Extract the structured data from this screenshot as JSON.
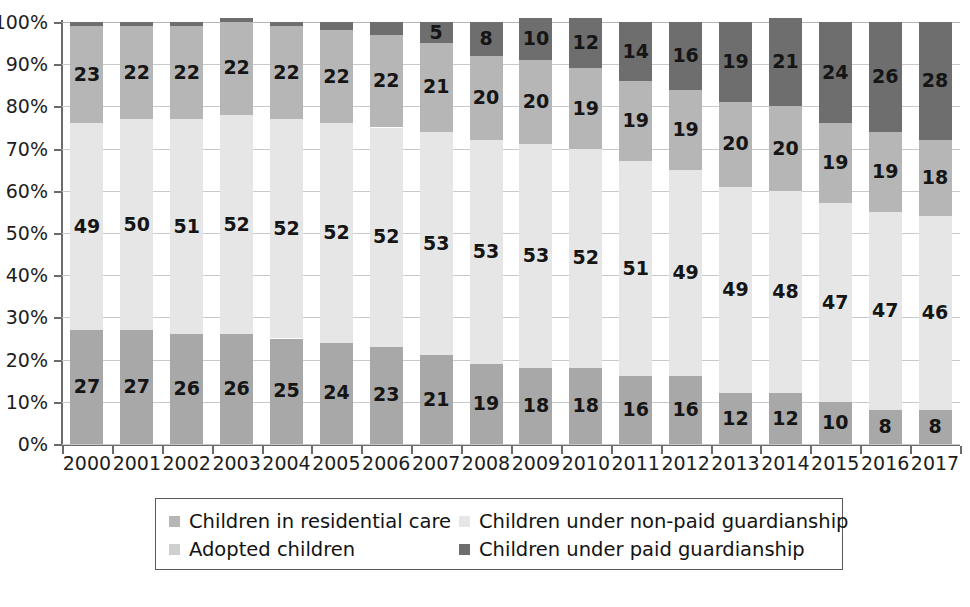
{
  "chart_data": {
    "type": "bar",
    "stacked": true,
    "stack_mode": "percent",
    "title": "",
    "subtitle": "",
    "xlabel": "",
    "ylabel": "",
    "ylim": [
      0,
      100
    ],
    "grid": true,
    "legend_position": "bottom",
    "categories": [
      "2000",
      "2001",
      "2002",
      "2003",
      "2004",
      "2005",
      "2006",
      "2007",
      "2008",
      "2009",
      "2010",
      "2011",
      "2012",
      "2013",
      "2014",
      "2015",
      "2016",
      "2017"
    ],
    "ytick_labels": [
      "100%",
      "90%",
      "80%",
      "70%",
      "60%",
      "50%",
      "40%",
      "30%",
      "20%",
      "10%",
      "0%"
    ],
    "ytick_values": [
      100,
      90,
      80,
      70,
      60,
      50,
      40,
      30,
      20,
      10,
      0
    ],
    "series": [
      {
        "name": "Adopted children",
        "color": "#a8a8a8",
        "order": 0,
        "values": [
          27,
          27,
          26,
          26,
          25,
          24,
          23,
          21,
          19,
          18,
          18,
          16,
          16,
          12,
          12,
          10,
          8,
          8
        ]
      },
      {
        "name": "Children under non-paid guardianship",
        "color": "#e6e6e6",
        "order": 1,
        "values": [
          49,
          50,
          51,
          52,
          52,
          52,
          52,
          53,
          53,
          53,
          52,
          51,
          49,
          49,
          48,
          47,
          47,
          46
        ]
      },
      {
        "name": "Children in residential care",
        "color": "#b6b6b6",
        "order": 2,
        "values": [
          23,
          22,
          22,
          22,
          22,
          22,
          22,
          21,
          20,
          20,
          19,
          19,
          19,
          20,
          20,
          19,
          19,
          18
        ]
      },
      {
        "name": "Children under paid guardianship",
        "color": "#6e6e6e",
        "order": 3,
        "values": [
          1,
          1,
          1,
          1,
          1,
          2,
          3,
          5,
          8,
          10,
          12,
          14,
          16,
          19,
          21,
          24,
          26,
          28
        ],
        "labeled_from_index": 6
      }
    ]
  },
  "legend": {
    "entries": [
      {
        "label": "Children in residential care",
        "color": "#b6b6b6"
      },
      {
        "label": "Children under non-paid guardianship",
        "color": "#e6e6e6"
      },
      {
        "label": "Adopted children",
        "color": "#cfcfcf"
      },
      {
        "label": "Children under paid guardianship",
        "color": "#6e6e6e"
      }
    ]
  },
  "colors": {
    "residential_care": "#b6b6b6",
    "non_paid_guardianship": "#e6e6e6",
    "adopted": "#a8a8a8",
    "paid_guardianship": "#6e6e6e",
    "axis": "#6b6b6b",
    "gridline": "#c9c9c9",
    "background": "#ffffff",
    "text": "#151515"
  }
}
